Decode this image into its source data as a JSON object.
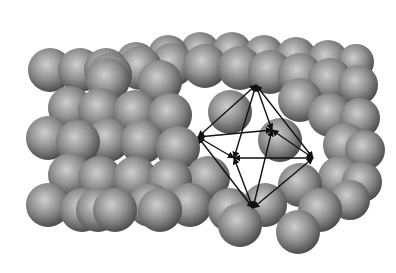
{
  "figure": {
    "background": "#ffffff",
    "sphere_color": "#8a8a8a",
    "sphere_highlight": "#c8c8c8",
    "sphere_shadow": "#4a4a4a",
    "arrow_color": "#111111"
  },
  "octahedron": {
    "vertices": {
      "top": [
        256,
        85
      ],
      "left": [
        198,
        137
      ],
      "right": [
        313,
        158
      ],
      "bottom": [
        253,
        208
      ],
      "back": [
        272,
        130
      ],
      "front": [
        234,
        158
      ]
    },
    "edges": [
      [
        "top",
        "left"
      ],
      [
        "top",
        "right"
      ],
      [
        "top",
        "back"
      ],
      [
        "top",
        "front"
      ],
      [
        "bottom",
        "left"
      ],
      [
        "bottom",
        "right"
      ],
      [
        "bottom",
        "back"
      ],
      [
        "bottom",
        "front"
      ],
      [
        "left",
        "back"
      ],
      [
        "left",
        "front"
      ],
      [
        "right",
        "back"
      ],
      [
        "right",
        "front"
      ]
    ]
  },
  "spheres": [
    [
      106,
      70,
      22
    ],
    [
      136,
      62,
      20
    ],
    [
      168,
      55,
      20
    ],
    [
      200,
      52,
      20
    ],
    [
      232,
      52,
      20
    ],
    [
      264,
      55,
      20
    ],
    [
      296,
      57,
      20
    ],
    [
      328,
      60,
      20
    ],
    [
      356,
      62,
      18
    ],
    [
      80,
      70,
      22
    ],
    [
      110,
      75,
      22
    ],
    [
      140,
      68,
      22
    ],
    [
      172,
      65,
      22
    ],
    [
      205,
      66,
      22
    ],
    [
      240,
      68,
      22
    ],
    [
      270,
      72,
      22
    ],
    [
      300,
      75,
      22
    ],
    [
      330,
      80,
      22
    ],
    [
      358,
      85,
      20
    ],
    [
      50,
      70,
      22
    ],
    [
      108,
      80,
      22
    ],
    [
      160,
      82,
      22
    ],
    [
      300,
      100,
      22
    ],
    [
      70,
      108,
      22
    ],
    [
      100,
      110,
      22
    ],
    [
      135,
      112,
      22
    ],
    [
      170,
      115,
      22
    ],
    [
      230,
      112,
      22
    ],
    [
      330,
      115,
      22
    ],
    [
      360,
      118,
      20
    ],
    [
      48,
      138,
      22
    ],
    [
      78,
      142,
      22
    ],
    [
      108,
      140,
      22
    ],
    [
      142,
      142,
      22
    ],
    [
      178,
      148,
      22
    ],
    [
      280,
      140,
      22
    ],
    [
      345,
      145,
      22
    ],
    [
      365,
      150,
      20
    ],
    [
      70,
      175,
      22
    ],
    [
      100,
      178,
      22
    ],
    [
      135,
      178,
      22
    ],
    [
      170,
      180,
      22
    ],
    [
      208,
      178,
      22
    ],
    [
      300,
      185,
      22
    ],
    [
      340,
      178,
      22
    ],
    [
      362,
      182,
      20
    ],
    [
      48,
      205,
      22
    ],
    [
      82,
      210,
      22
    ],
    [
      115,
      210,
      22
    ],
    [
      150,
      205,
      22
    ],
    [
      190,
      205,
      22
    ],
    [
      230,
      210,
      22
    ],
    [
      265,
      205,
      22
    ],
    [
      320,
      210,
      22
    ],
    [
      350,
      200,
      20
    ],
    [
      98,
      210,
      22
    ],
    [
      160,
      210,
      22
    ],
    [
      240,
      225,
      22
    ],
    [
      298,
      232,
      22
    ]
  ]
}
